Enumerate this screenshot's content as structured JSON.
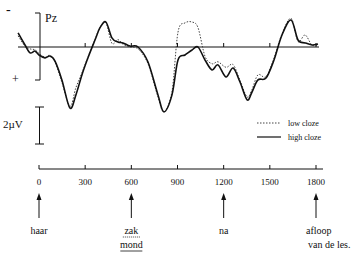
{
  "chart_data": {
    "type": "line",
    "title": "",
    "electrode": "Pz",
    "polarity": {
      "negative_label": "-",
      "positive_label": "+",
      "negative_up": true
    },
    "scale_bar": {
      "label": "2µV",
      "value_uv": 2
    },
    "xlabel": "",
    "ylabel": "",
    "x_unit": "ms",
    "y_unit": "µV",
    "xlim": [
      -140,
      1830
    ],
    "xticks": [
      0,
      300,
      600,
      900,
      1200,
      1500,
      1800
    ],
    "xtick_labels": [
      "0",
      "300",
      "600",
      "900",
      "1200",
      "1500",
      "1800"
    ],
    "grid": false,
    "legend": {
      "position": "right",
      "entries": [
        {
          "name": "low cloze",
          "style": "dotted"
        },
        {
          "name": "high cloze",
          "style": "solid"
        }
      ]
    },
    "series": [
      {
        "name": "high cloze",
        "style": "solid",
        "x": [
          -136,
          -91,
          -58,
          -26,
          0,
          39,
          71,
          104,
          149,
          201,
          240,
          279,
          318,
          364,
          396,
          435,
          474,
          513,
          546,
          591,
          643,
          708,
          773,
          812,
          864,
          903,
          949,
          994,
          1033,
          1079,
          1124,
          1163,
          1215,
          1261,
          1306,
          1352,
          1384,
          1423,
          1475,
          1527,
          1579,
          1638,
          1683,
          1729,
          1774,
          1813
        ],
        "y": [
          -0.76,
          -0.11,
          0.32,
          0.22,
          0.43,
          0.59,
          0.49,
          0.76,
          1.78,
          3.3,
          2.59,
          1.51,
          0.59,
          -0.38,
          -1.03,
          -1.35,
          -0.49,
          -0.27,
          -0.22,
          -0.05,
          0.0,
          0.81,
          2.59,
          3.51,
          2.59,
          0.7,
          0.43,
          0.16,
          0.0,
          0.7,
          1.24,
          0.97,
          1.62,
          1.14,
          1.89,
          2.86,
          2.43,
          1.78,
          1.68,
          0.7,
          -0.65,
          -1.46,
          -0.38,
          -0.22,
          -0.11,
          -0.16
        ]
      },
      {
        "name": "low cloze",
        "style": "dotted",
        "x": [
          -136,
          -91,
          -58,
          -26,
          0,
          39,
          71,
          104,
          149,
          201,
          240,
          279,
          318,
          364,
          396,
          435,
          474,
          513,
          546,
          591,
          643,
          708,
          773,
          812,
          864,
          903,
          949,
          994,
          1033,
          1079,
          1124,
          1163,
          1215,
          1261,
          1306,
          1352,
          1384,
          1423,
          1475,
          1527,
          1579,
          1638,
          1683,
          1729,
          1774,
          1813
        ],
        "y": [
          -0.6,
          -0.05,
          0.1,
          0.15,
          0.35,
          0.55,
          0.45,
          0.8,
          1.9,
          3.2,
          2.2,
          1.4,
          0.55,
          -0.4,
          -1.05,
          -1.3,
          -0.2,
          -0.4,
          -0.15,
          0.0,
          0.1,
          0.9,
          2.7,
          3.5,
          2.4,
          -0.8,
          -1.3,
          -1.35,
          -1.05,
          0.5,
          0.9,
          0.8,
          1.1,
          0.95,
          1.8,
          2.7,
          2.3,
          1.5,
          1.6,
          0.6,
          -0.7,
          -1.55,
          -0.3,
          -0.65,
          -0.1,
          -0.1
        ]
      }
    ],
    "events": [
      {
        "ms": 0,
        "words": [
          "haar"
        ],
        "underline": [
          "none"
        ]
      },
      {
        "ms": 600,
        "words": [
          "zak",
          "mond"
        ],
        "underline": [
          "dotted",
          "solid"
        ]
      },
      {
        "ms": 1200,
        "words": [
          "na"
        ],
        "underline": [
          "none"
        ]
      },
      {
        "ms": 1800,
        "words": [
          "afloop",
          "van de les."
        ],
        "underline": [
          "none",
          "none"
        ]
      }
    ]
  }
}
